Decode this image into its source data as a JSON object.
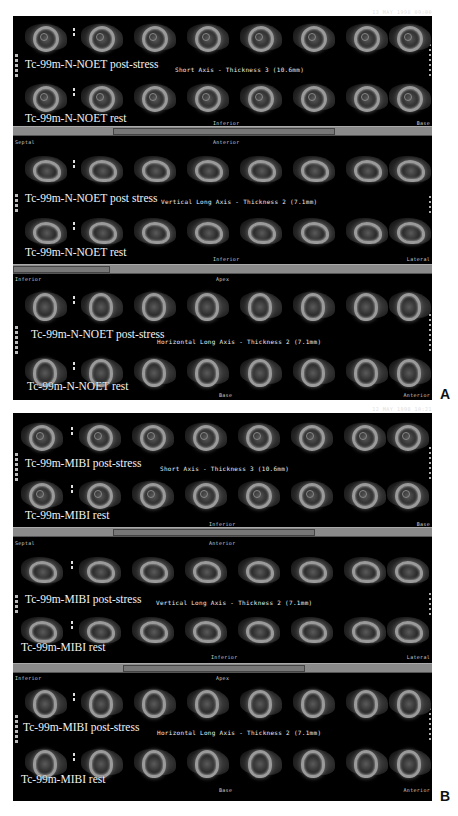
{
  "figure": {
    "panels": [
      {
        "letter": "A",
        "date_stamp": "13 MAY 1998 09:00",
        "tracer": "Tc-99m-N-NOET",
        "sections": [
          {
            "axis_title": "Short Axis - Thickness 3 (10.6mm)",
            "top_left_orient": "",
            "top_center_orient": "",
            "bottom_center_orient": "Inferior",
            "bottom_right_orient": "Base",
            "row_labels": [
              "Tc-99m-N-NOET post-stress",
              "Tc-99m-N-NOET rest"
            ],
            "view": "sa"
          },
          {
            "axis_title": "Vertical Long Axis - Thickness 2 (7.1mm)",
            "top_left_orient": "Septal",
            "top_center_orient": "Anterior",
            "bottom_center_orient": "Inferior",
            "bottom_right_orient": "Lateral",
            "row_labels": [
              "Tc-99m-N-NOET post stress",
              "Tc-99m-N-NOET rest"
            ],
            "view": "vla"
          },
          {
            "axis_title": "Horizontal Long Axis - Thickness 2 (7.1mm)",
            "top_left_orient": "Inferior",
            "top_center_orient": "Apex",
            "bottom_center_orient": "Base",
            "bottom_right_orient": "Anterior",
            "row_labels": [
              "Tc-99m-N-NOET post-stress",
              "Tc-99m-N-NOET rest"
            ],
            "view": "hla"
          }
        ]
      },
      {
        "letter": "B",
        "date_stamp": "12 MAY 1998 10:21",
        "tracer": "Tc-99m-MIBI",
        "sections": [
          {
            "axis_title": "Short Axis - Thickness 3 (10.6mm)",
            "top_left_orient": "",
            "top_center_orient": "",
            "bottom_center_orient": "Inferior",
            "bottom_right_orient": "Base",
            "row_labels": [
              "Tc-99m-MIBI post-stress",
              "Tc-99m-MIBI rest"
            ],
            "view": "sa"
          },
          {
            "axis_title": "Vertical Long Axis - Thickness 2 (7.1mm)",
            "top_left_orient": "Septal",
            "top_center_orient": "Anterior",
            "bottom_center_orient": "Inferior",
            "bottom_right_orient": "Lateral",
            "row_labels": [
              "Tc-99m-MIBI post-stress",
              "Tc-99m-MIBI rest"
            ],
            "view": "vla"
          },
          {
            "axis_title": "Horizontal Long Axis - Thickness 2 (7.1mm)",
            "top_left_orient": "Inferior",
            "top_center_orient": "Apex",
            "bottom_center_orient": "Base",
            "bottom_right_orient": "Anterior",
            "row_labels": [
              "Tc-99m-MIBI post-stress",
              "Tc-99m-MIBI rest"
            ],
            "view": "hla"
          }
        ]
      }
    ],
    "slices_per_row": 8
  },
  "colors": {
    "background": "#ffffff",
    "panel": "#000000",
    "scrollbar": "#8a8a8a",
    "label": "#f2f2f2"
  }
}
